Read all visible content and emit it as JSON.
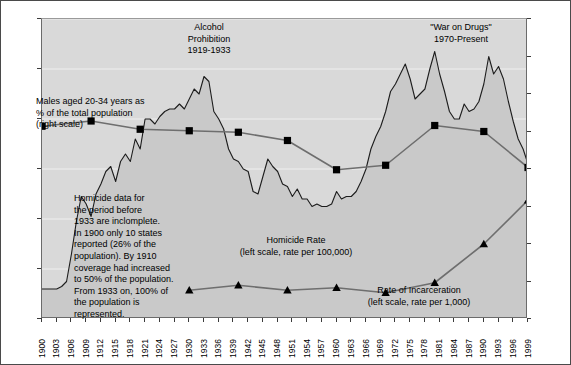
{
  "chart_data": {
    "type": "line",
    "title": "",
    "xlabel": "",
    "ylabel": "",
    "ylim": [
      0,
      12
    ],
    "y2lim": [
      0,
      40
    ],
    "grid": true,
    "legend_position": "inline-annotations",
    "x_tick_labels": [
      "1900",
      "1903",
      "1906",
      "1909",
      "1912",
      "1915",
      "1918",
      "1921",
      "1924",
      "1927",
      "1930",
      "1933",
      "1936",
      "1939",
      "1942",
      "1945",
      "1948",
      "1951",
      "1954",
      "1957",
      "1960",
      "1963",
      "1966",
      "1969",
      "1972",
      "1975",
      "1978",
      "1981",
      "1984",
      "1987",
      "1990",
      "1993",
      "1996",
      "1999"
    ],
    "y_tick_labels": [
      "0",
      "2",
      "4",
      "6",
      "8",
      "10",
      "12"
    ],
    "y2_tick_labels": [
      "0%",
      "5%",
      "10%",
      "15%",
      "20%",
      "25%",
      "30%",
      "35%",
      "40%"
    ],
    "series": [
      {
        "name": "Homicide Rate",
        "axis": "left",
        "style": "area",
        "units": "rate per 100,000",
        "x": [
          1900,
          1901,
          1902,
          1903,
          1904,
          1905,
          1906,
          1907,
          1908,
          1909,
          1910,
          1911,
          1912,
          1913,
          1914,
          1915,
          1916,
          1917,
          1918,
          1919,
          1920,
          1921,
          1922,
          1923,
          1924,
          1925,
          1926,
          1927,
          1928,
          1929,
          1930,
          1931,
          1932,
          1933,
          1934,
          1935,
          1936,
          1937,
          1938,
          1939,
          1940,
          1941,
          1942,
          1943,
          1944,
          1945,
          1946,
          1947,
          1948,
          1949,
          1950,
          1951,
          1952,
          1953,
          1954,
          1955,
          1956,
          1957,
          1958,
          1959,
          1960,
          1961,
          1962,
          1963,
          1964,
          1965,
          1966,
          1967,
          1968,
          1969,
          1970,
          1971,
          1972,
          1973,
          1974,
          1975,
          1976,
          1977,
          1978,
          1979,
          1980,
          1981,
          1982,
          1983,
          1984,
          1985,
          1986,
          1987,
          1988,
          1989,
          1990,
          1991,
          1992,
          1993,
          1994,
          1995,
          1996,
          1997,
          1998,
          1999
        ],
        "values": [
          1.2,
          1.2,
          1.2,
          1.2,
          1.3,
          1.5,
          2.6,
          3.9,
          4.9,
          4.6,
          4.1,
          5.0,
          5.4,
          5.9,
          6.1,
          5.5,
          6.3,
          6.6,
          6.3,
          7.2,
          6.8,
          8.0,
          8.0,
          7.8,
          8.1,
          8.3,
          8.4,
          8.4,
          8.6,
          8.4,
          8.8,
          9.2,
          9.0,
          9.7,
          9.5,
          8.3,
          8.0,
          7.6,
          6.8,
          6.4,
          6.3,
          6.0,
          5.9,
          5.1,
          5.0,
          5.7,
          6.4,
          6.1,
          5.9,
          5.4,
          5.3,
          4.9,
          5.2,
          4.8,
          4.8,
          4.5,
          4.6,
          4.5,
          4.5,
          4.6,
          5.1,
          4.8,
          4.9,
          4.9,
          5.1,
          5.5,
          6.0,
          6.8,
          7.3,
          7.7,
          8.3,
          9.1,
          9.4,
          9.8,
          10.2,
          9.6,
          8.8,
          9.0,
          9.2,
          10.0,
          10.7,
          9.8,
          9.1,
          8.3,
          8.0,
          8.0,
          8.6,
          8.3,
          8.4,
          8.7,
          9.4,
          10.5,
          9.8,
          10.1,
          9.6,
          8.7,
          7.9,
          7.2,
          6.8,
          6.2
        ]
      },
      {
        "name": "Males aged 20-34 years as % of the total population",
        "axis": "right",
        "style": "line-square",
        "units": "percent",
        "x": [
          1900,
          1910,
          1920,
          1930,
          1940,
          1950,
          1960,
          1970,
          1980,
          1990,
          1999
        ],
        "values": [
          25.7,
          26.4,
          25.3,
          25.1,
          24.9,
          23.8,
          19.9,
          20.5,
          25.8,
          25.0,
          20.2
        ]
      },
      {
        "name": "Rate of Incarceration",
        "axis": "left",
        "style": "line-triangle",
        "units": "rate per 1,000",
        "x": [
          1930,
          1940,
          1950,
          1960,
          1970,
          1980,
          1990,
          1999
        ],
        "values": [
          1.15,
          1.35,
          1.15,
          1.25,
          1.05,
          1.45,
          3.0,
          4.75
        ]
      }
    ],
    "annotations": [
      {
        "id": "prohibition",
        "text": "Alcohol\nProhibition\n1919-1933"
      },
      {
        "id": "war-on-drugs",
        "text": "\"War on Drugs\"\n1970-Present"
      },
      {
        "id": "males-label",
        "text": "Males aged 20-34 years as\n% of the total population\n(right scale)"
      },
      {
        "id": "data-caveat",
        "text": "Homicide data for\nthe period before\n1933 are inclomplete.\nIn 1900 only 10 states\nreported (26% of the\npopulation). By 1910\ncoverage had increased\nto 50% of the population.\nFrom 1933 on, 100% of\nthe population is\nrepresented."
      },
      {
        "id": "homicide-label",
        "text": "Homicide Rate\n(left scale, rate per 100,000)"
      },
      {
        "id": "incarceration-label",
        "text": "Rate of Incarceration\n(left scale, rate per 1,000)"
      }
    ],
    "colors": {
      "plot_background": "#d9d9d9",
      "area_fill": "#c9c9c9",
      "area_line": "#1c1c1c",
      "marker_line": "#6e6e6e",
      "marker_fill": "#000000",
      "gridline": "#efefef",
      "border": "#4a4a4a"
    }
  }
}
